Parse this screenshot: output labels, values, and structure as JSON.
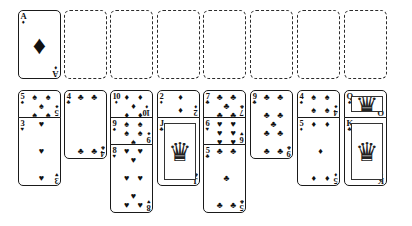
{
  "app": {
    "title": "Solitaire",
    "theme": "monochrome",
    "ink_color": "#111111",
    "background_color": "#ffffff",
    "empty_slot_border_color": "#2b2b2b"
  },
  "suits": {
    "spade": "♠",
    "heart": "♥",
    "diamond": "♦",
    "club": "♣"
  },
  "foundations": {
    "label": "foundation-row",
    "count": 8,
    "slots": [
      {
        "occupied": true,
        "rank": "A",
        "suit": "♦",
        "suit_name": "diamond"
      },
      {
        "occupied": false,
        "rank": "",
        "suit": "",
        "suit_name": ""
      },
      {
        "occupied": false,
        "rank": "",
        "suit": "",
        "suit_name": ""
      },
      {
        "occupied": false,
        "rank": "",
        "suit": "",
        "suit_name": ""
      },
      {
        "occupied": false,
        "rank": "",
        "suit": "",
        "suit_name": ""
      },
      {
        "occupied": false,
        "rank": "",
        "suit": "",
        "suit_name": ""
      },
      {
        "occupied": false,
        "rank": "",
        "suit": "",
        "suit_name": ""
      },
      {
        "occupied": false,
        "rank": "",
        "suit": "",
        "suit_name": ""
      }
    ]
  },
  "tableau": {
    "label": "tableau-row",
    "column_count": 8,
    "columns": [
      {
        "index": 1,
        "cards": [
          {
            "rank": "5",
            "suit": "♠",
            "suit_name": "spade",
            "pips": 5
          },
          {
            "rank": "3",
            "suit": "♥",
            "suit_name": "heart",
            "pips": 3
          }
        ]
      },
      {
        "index": 2,
        "cards": [
          {
            "rank": "4",
            "suit": "♣",
            "suit_name": "club",
            "pips": 4
          }
        ]
      },
      {
        "index": 3,
        "cards": [
          {
            "rank": "10",
            "suit": "♦",
            "suit_name": "diamond",
            "pips": 10
          },
          {
            "rank": "9",
            "suit": "♠",
            "suit_name": "spade",
            "pips": 9
          },
          {
            "rank": "8",
            "suit": "♥",
            "suit_name": "heart",
            "pips": 8
          }
        ]
      },
      {
        "index": 4,
        "cards": [
          {
            "rank": "2",
            "suit": "♦",
            "suit_name": "diamond",
            "pips": 2
          },
          {
            "rank": "J",
            "suit": "♣",
            "suit_name": "club",
            "pips": 0
          }
        ]
      },
      {
        "index": 5,
        "cards": [
          {
            "rank": "7",
            "suit": "♣",
            "suit_name": "club",
            "pips": 7
          },
          {
            "rank": "6",
            "suit": "♥",
            "suit_name": "heart",
            "pips": 6
          },
          {
            "rank": "5",
            "suit": "♣",
            "suit_name": "club",
            "pips": 5
          }
        ]
      },
      {
        "index": 6,
        "cards": [
          {
            "rank": "9",
            "suit": "♣",
            "suit_name": "club",
            "pips": 9
          }
        ]
      },
      {
        "index": 7,
        "cards": [
          {
            "rank": "4",
            "suit": "♠",
            "suit_name": "spade",
            "pips": 4
          },
          {
            "rank": "5",
            "suit": "♦",
            "suit_name": "diamond",
            "pips": 5
          }
        ]
      },
      {
        "index": 8,
        "cards": [
          {
            "rank": "Q",
            "suit": "♠",
            "suit_name": "spade",
            "pips": 0
          },
          {
            "rank": "K",
            "suit": "♣",
            "suit_name": "club",
            "pips": 0
          }
        ]
      }
    ]
  },
  "layout": {
    "card_width": 43,
    "card_height": 69,
    "column_x": [
      18,
      64,
      110,
      157,
      203,
      250,
      297,
      344
    ],
    "foundation_y": 10,
    "tableau_y": 90,
    "stack_offset_y": 27
  }
}
